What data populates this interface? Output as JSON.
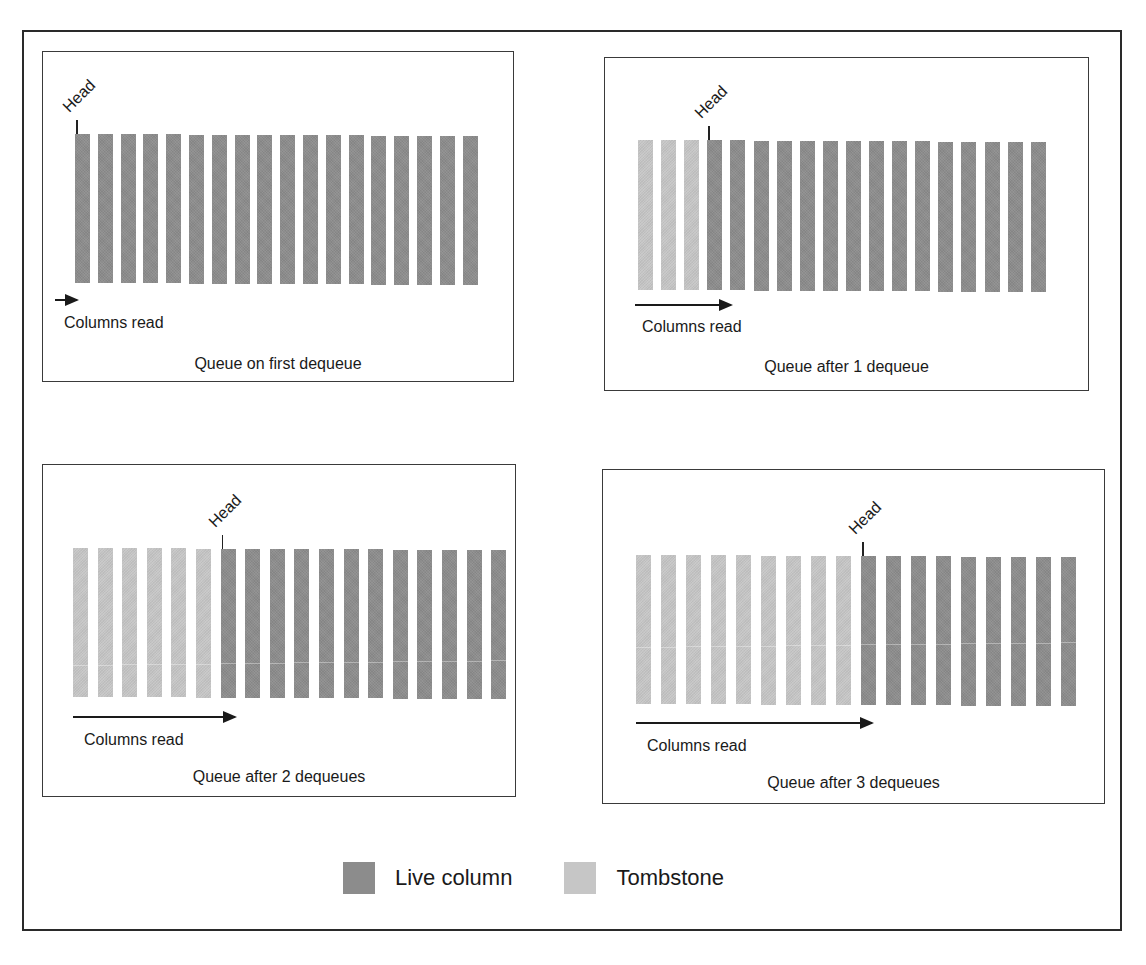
{
  "figure": {
    "panels": [
      {
        "id": "panel-1",
        "caption": "Queue on first dequeue",
        "head_label": "Head",
        "arrow_label": "Columns read",
        "tombstones": 0,
        "live_columns": 18,
        "box": {
          "left": 42,
          "top": 51,
          "width": 472,
          "height": 331
        },
        "bars_top": 134,
        "bars_height": 149,
        "bars_left": 75,
        "bars_pitch": 22.8,
        "seam": false,
        "arrow": {
          "left": 55,
          "top": 299,
          "width": 22
        },
        "cols_read": {
          "left": 64,
          "top": 314
        },
        "caption_top": 355
      },
      {
        "id": "panel-2",
        "caption": "Queue after 1 dequeue",
        "head_label": "Head",
        "arrow_label": "Columns read",
        "tombstones": 3,
        "live_columns": 15,
        "box": {
          "left": 604,
          "top": 57,
          "width": 485,
          "height": 334
        },
        "bars_top": 140,
        "bars_height": 150,
        "bars_left": 638,
        "bars_pitch": 23.1,
        "seam": false,
        "arrow": {
          "left": 635,
          "top": 304,
          "width": 96
        },
        "cols_read": {
          "left": 642,
          "top": 318
        },
        "caption_top": 358
      },
      {
        "id": "panel-3",
        "caption": "Queue after 2 dequeues",
        "head_label": "Head",
        "arrow_label": "Columns read",
        "tombstones": 6,
        "live_columns": 12,
        "box": {
          "left": 42,
          "top": 464,
          "width": 474,
          "height": 333
        },
        "bars_top": 548,
        "bars_height": 149,
        "bars_left": 73,
        "bars_pitch": 24.6,
        "seam": true,
        "seam_offset": 117,
        "arrow": {
          "left": 73,
          "top": 716,
          "width": 162
        },
        "cols_read": {
          "left": 84,
          "top": 731
        },
        "caption_top": 768
      },
      {
        "id": "panel-4",
        "caption": "Queue after 3 dequeues",
        "head_label": "Head",
        "arrow_label": "Columns read",
        "tombstones": 9,
        "live_columns": 9,
        "box": {
          "left": 602,
          "top": 469,
          "width": 503,
          "height": 335
        },
        "bars_top": 555,
        "bars_height": 149,
        "bars_left": 636,
        "bars_pitch": 25.0,
        "seam": true,
        "seam_offset": 92,
        "arrow": {
          "left": 636,
          "top": 722,
          "width": 236
        },
        "cols_read": {
          "left": 647,
          "top": 737
        },
        "caption_top": 774
      }
    ],
    "legend": {
      "live_label": "Live column",
      "tombstone_label": "Tombstone"
    },
    "colors": {
      "live": "#8c8c8c",
      "tombstone": "#c6c6c6",
      "border": "#2a2a2a"
    }
  }
}
